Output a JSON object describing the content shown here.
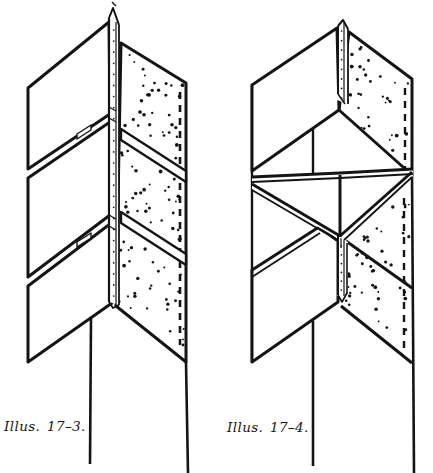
{
  "page": {
    "background": "#ffffff",
    "ink": "#141414",
    "paper": "#ffffff"
  },
  "figures": [
    {
      "id": "illus-17-3",
      "caption": "Illus. 17–3."
    },
    {
      "id": "illus-17-4",
      "caption": "Illus. 17–4."
    }
  ]
}
